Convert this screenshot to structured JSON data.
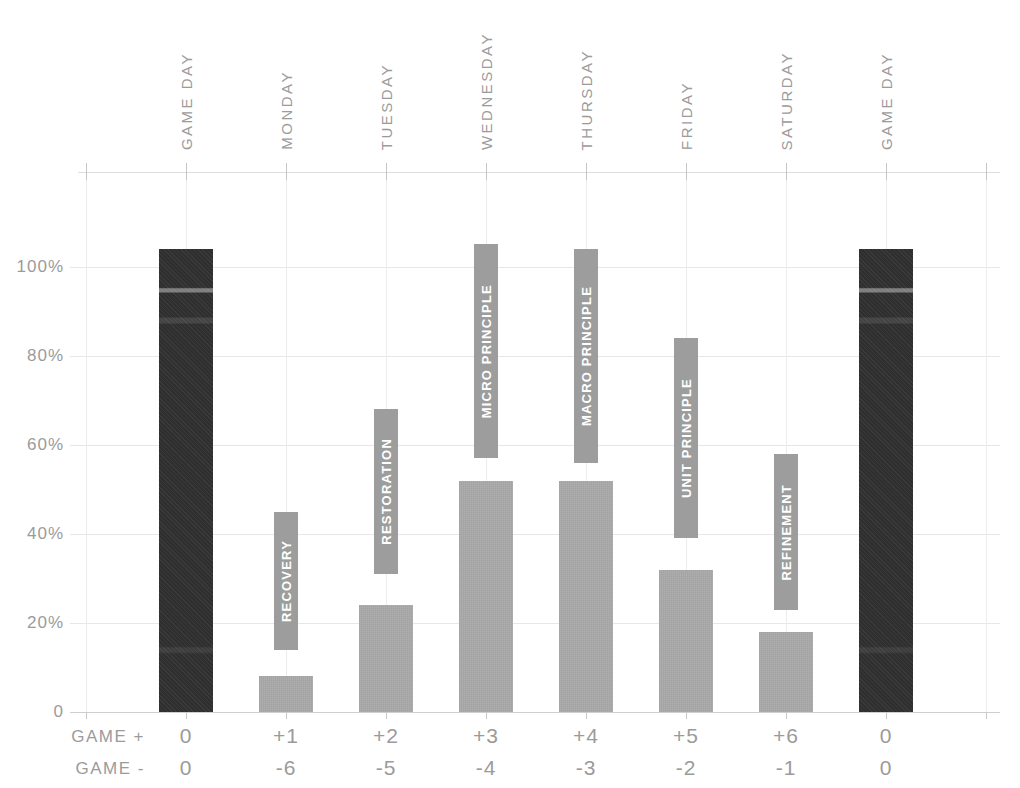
{
  "chart_data": {
    "type": "bar",
    "ylabel": "",
    "xlabel": "",
    "ylim": [
      0,
      120
    ],
    "grid": true,
    "y_ticks": [
      {
        "label": "100%",
        "value": 100
      },
      {
        "label": "80%",
        "value": 80
      },
      {
        "label": "60%",
        "value": 60
      },
      {
        "label": "40%",
        "value": 40
      },
      {
        "label": "20%",
        "value": 20
      },
      {
        "label": "0",
        "value": 0
      }
    ],
    "categories": [
      "GAME DAY",
      "MONDAY",
      "TUESDAY",
      "WEDNESDAY",
      "THURSDAY",
      "FRIDAY",
      "SATURDAY",
      "GAME DAY"
    ],
    "values": [
      104,
      8,
      24,
      52,
      52,
      32,
      18,
      104
    ],
    "columns": [
      {
        "day": "GAME DAY",
        "value_pct": 104,
        "bar": "dark",
        "phase": null,
        "tag_from_pct": null,
        "tag_to_pct": null,
        "game_plus": "0",
        "game_minus": "0"
      },
      {
        "day": "MONDAY",
        "value_pct": 8,
        "bar": "light",
        "phase": "RECOVERY",
        "tag_from_pct": 14,
        "tag_to_pct": 45,
        "game_plus": "+1",
        "game_minus": "-6"
      },
      {
        "day": "TUESDAY",
        "value_pct": 24,
        "bar": "light",
        "phase": "RESTORATION",
        "tag_from_pct": 31,
        "tag_to_pct": 68,
        "game_plus": "+2",
        "game_minus": "-5"
      },
      {
        "day": "WEDNESDAY",
        "value_pct": 52,
        "bar": "light",
        "phase": "MICRO PRINCIPLE",
        "tag_from_pct": 57,
        "tag_to_pct": 105,
        "game_plus": "+3",
        "game_minus": "-4"
      },
      {
        "day": "THURSDAY",
        "value_pct": 52,
        "bar": "light",
        "phase": "MACRO PRINCIPLE",
        "tag_from_pct": 56,
        "tag_to_pct": 104,
        "game_plus": "+4",
        "game_minus": "-3"
      },
      {
        "day": "FRIDAY",
        "value_pct": 32,
        "bar": "light",
        "phase": "UNIT PRINCIPLE",
        "tag_from_pct": 39,
        "tag_to_pct": 84,
        "game_plus": "+5",
        "game_minus": "-2"
      },
      {
        "day": "SATURDAY",
        "value_pct": 18,
        "bar": "light",
        "phase": "REFINEMENT",
        "tag_from_pct": 23,
        "tag_to_pct": 58,
        "game_plus": "+6",
        "game_minus": "-1"
      },
      {
        "day": "GAME DAY",
        "value_pct": 104,
        "bar": "dark",
        "phase": null,
        "tag_from_pct": null,
        "tag_to_pct": null,
        "game_plus": "0",
        "game_minus": "0"
      }
    ],
    "row_labels": {
      "plus": "GAME +",
      "minus": "GAME -"
    },
    "legend": null,
    "colors": {
      "dark_bar": "#2f2f2f",
      "light_bar": "#a9a9a9",
      "tag": "#9d9d9d",
      "tag_text": "#ffffff",
      "grid": "#e7e7e7",
      "axis": "#cfcfcf",
      "tick": "#c6c6c6",
      "text": "#9b9b9b",
      "background": "#ffffff"
    }
  }
}
